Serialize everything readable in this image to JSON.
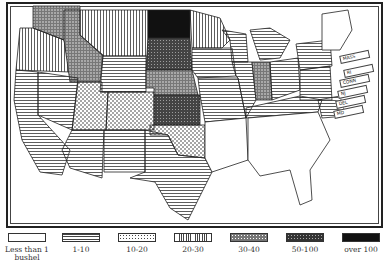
{
  "map": {
    "title": "",
    "states_by_class": {
      "over_100": [
        "North Dakota"
      ],
      "50_100": [
        "South Dakota",
        "Kansas"
      ],
      "30_40": [
        "Washington",
        "Idaho",
        "Nebraska",
        "Indiana"
      ],
      "10_20": [
        "Utah",
        "Colorado",
        "Oklahoma"
      ],
      "20_30": [
        "Oregon",
        "Montana",
        "Minnesota"
      ],
      "1_10": [
        "California",
        "Nevada",
        "Arizona",
        "New Mexico",
        "Wyoming",
        "Texas",
        "Iowa",
        "Missouri",
        "Wisconsin",
        "Michigan",
        "Illinois",
        "Ohio",
        "Kentucky",
        "Tennessee",
        "Virginia",
        "North Carolina",
        "Pennsylvania",
        "New York",
        "West Virginia",
        "Maryland",
        "Delaware",
        "New Jersey",
        "Arkansas"
      ],
      "less_than_1": [
        "Louisiana",
        "Mississippi",
        "Alabama",
        "Georgia",
        "Florida",
        "South Carolina",
        "Maine",
        "New Hampshire",
        "Vermont",
        "Massachusetts",
        "Rhode Island",
        "Connecticut"
      ]
    },
    "callouts": [
      "MASS",
      "RI",
      "CONN",
      "NJ",
      "DEL",
      "MD"
    ]
  },
  "legend": {
    "items": [
      {
        "label": "less than 1 bushel",
        "label_line1": "Less than 1",
        "label_line2": "bushel",
        "pattern": "blank"
      },
      {
        "label": "1-10",
        "pattern": "horizontal-lines"
      },
      {
        "label": "10-20",
        "pattern": "light-dots"
      },
      {
        "label": "20-30",
        "pattern": "vertical-lines"
      },
      {
        "label": "30-40",
        "pattern": "dense-dots"
      },
      {
        "label": "50-100",
        "pattern": "dark-dots"
      },
      {
        "label": "over 100",
        "pattern": "solid-black"
      }
    ]
  },
  "colors": {
    "ink": "#222222",
    "paper": "#ffffff"
  }
}
